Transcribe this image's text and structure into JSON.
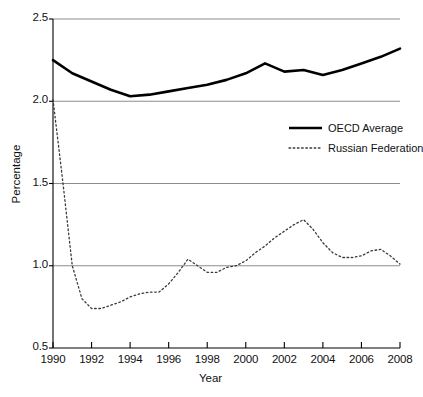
{
  "chart_data": {
    "type": "line",
    "title": "",
    "xlabel": "Year",
    "ylabel": "Percentage",
    "xlim": [
      1990,
      2008
    ],
    "ylim": [
      0.5,
      2.5
    ],
    "grid": true,
    "gridlines_y": [
      1.0,
      1.5,
      2.0,
      2.5
    ],
    "legend_position": "upper right",
    "x": [
      1990,
      1991,
      1992,
      1993,
      1994,
      1995,
      1996,
      1997,
      1998,
      1999,
      2000,
      2001,
      2002,
      2003,
      2004,
      2005,
      2006,
      2007,
      2008
    ],
    "x_tick_labels": [
      "1990",
      "1992",
      "1994",
      "1996",
      "1998",
      "2000",
      "2002",
      "2004",
      "2006",
      "2008"
    ],
    "y_tick_labels": [
      "0.5",
      "1.0",
      "1.5",
      "2.0",
      "2.5"
    ],
    "series": [
      {
        "name": "OECD Average",
        "style": "solid",
        "color": "#000000",
        "width": 2.6,
        "values": [
          2.25,
          2.17,
          2.12,
          2.07,
          2.03,
          2.04,
          2.06,
          2.08,
          2.1,
          2.13,
          2.17,
          2.23,
          2.18,
          2.19,
          2.16,
          2.19,
          2.23,
          2.27,
          2.32
        ]
      },
      {
        "name": "Russian Federation",
        "style": "dotted",
        "color": "#3a3a3a",
        "width": 1.3,
        "values": [
          2.01,
          1.5,
          0.74,
          0.75,
          0.79,
          0.84,
          0.84,
          0.95,
          1.03,
          0.96,
          0.98,
          1.0,
          1.09,
          1.16,
          1.25,
          1.28,
          1.19,
          1.06,
          1.05
        ]
      }
    ],
    "series_russia_detailed_x": [
      1990,
      1990.5,
      1991,
      1991.5,
      1992,
      1992.5,
      1993,
      1993.5,
      1994,
      1994.5,
      1995,
      1995.5,
      1996,
      1996.5,
      1997,
      1997.5,
      1998,
      1998.5,
      1999,
      1999.5,
      2000,
      2000.5,
      2001,
      2001.5,
      2002,
      2002.5,
      2003,
      2003.5,
      2004,
      2004.5,
      2005,
      2005.5,
      2006,
      2006.5,
      2007,
      2007.5,
      2008
    ],
    "series_russia_detailed_y": [
      2.01,
      1.52,
      1.0,
      0.8,
      0.74,
      0.74,
      0.76,
      0.78,
      0.81,
      0.83,
      0.84,
      0.84,
      0.89,
      0.96,
      1.04,
      1.0,
      0.96,
      0.96,
      0.99,
      1.0,
      1.03,
      1.08,
      1.12,
      1.17,
      1.21,
      1.25,
      1.28,
      1.22,
      1.14,
      1.08,
      1.05,
      1.05,
      1.06,
      1.09,
      1.1,
      1.06,
      1.01
    ]
  },
  "axes": {
    "y_ticks": [
      {
        "label": "2.5",
        "value": 2.5
      },
      {
        "label": "2.0",
        "value": 2.0
      },
      {
        "label": "1.5",
        "value": 1.5
      },
      {
        "label": "1.0",
        "value": 1.0
      },
      {
        "label": "0.5",
        "value": 0.5
      }
    ],
    "x_ticks": [
      {
        "label": "1990",
        "value": 1990
      },
      {
        "label": "1992",
        "value": 1992
      },
      {
        "label": "1994",
        "value": 1994
      },
      {
        "label": "1996",
        "value": 1996
      },
      {
        "label": "1998",
        "value": 1998
      },
      {
        "label": "2000",
        "value": 2000
      },
      {
        "label": "2002",
        "value": 2002
      },
      {
        "label": "2004",
        "value": 2004
      },
      {
        "label": "2006",
        "value": 2006
      },
      {
        "label": "2008",
        "value": 2008
      }
    ],
    "x_title": "Year",
    "y_title": "Percentage"
  },
  "legend": {
    "entries": [
      {
        "label": "OECD Average",
        "style": "solid"
      },
      {
        "label": "Russian Federation",
        "style": "dotted"
      }
    ]
  },
  "colors": {
    "background": "#ffffff",
    "axis": "#000000",
    "gridline": "#8c8c8c",
    "series_solid": "#000000",
    "series_dotted": "#3a3a3a"
  }
}
